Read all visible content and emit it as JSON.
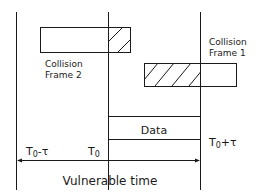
{
  "diagram": {
    "frames": [
      {
        "id": "collision-frame-2",
        "label_line1": "Collision",
        "label_line2": "Frame 2"
      },
      {
        "id": "collision-frame-1",
        "label_line1": "Collision",
        "label_line2": "Frame 1"
      }
    ],
    "data_label": "Data",
    "time_labels": {
      "left": {
        "base": "T",
        "sub": "0",
        "suffix": "-τ"
      },
      "center": {
        "base": "T",
        "sub": "0",
        "suffix": ""
      },
      "right": {
        "base": "T",
        "sub": "0",
        "suffix": "+τ"
      }
    },
    "caption": "Vulnerable time",
    "colors": {
      "stroke": "#1a1a1a",
      "background": "#ffffff"
    }
  }
}
